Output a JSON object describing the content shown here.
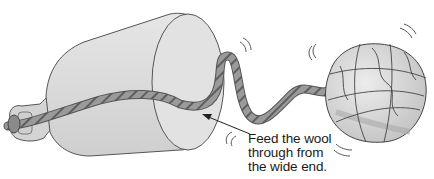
{
  "illustration": {
    "subject": "glass bottle with wool strand fed through it, attached to a ball of wool",
    "elements": [
      "bottle",
      "wool-strand",
      "wool-ball",
      "pointer-arrow",
      "motion-lines"
    ],
    "colors": {
      "bottle_fill": "#d9d9d9",
      "bottle_outline": "#555555",
      "wool": "#8c8c8c",
      "wool_stripe": "#5a5a5a",
      "ball_fill": "#d6d6d6",
      "ball_lines": "#444444"
    }
  },
  "caption": {
    "line1": "Feed the wool",
    "line2": "through from",
    "line3": "the wide end."
  }
}
